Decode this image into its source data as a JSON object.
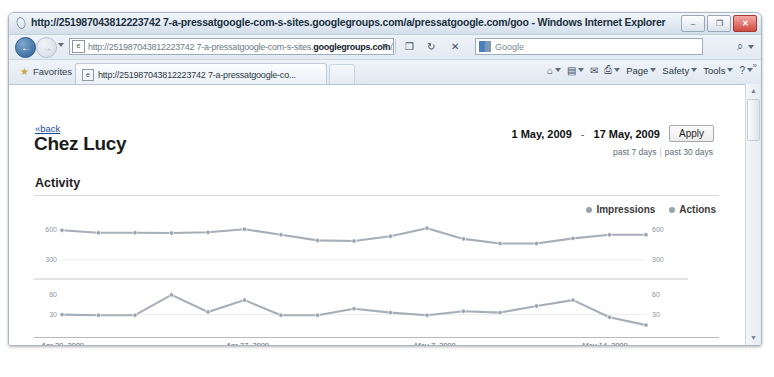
{
  "window": {
    "title": "http://251987043812223742 7-a-pressatgoogle-com-s-sites.googlegroups.com/a/pressatgoogle.com/goo - Windows Internet Explorer",
    "minimize_label": "–",
    "maximize_label": "❐",
    "close_label": "✕"
  },
  "navigation": {
    "back_label": "←",
    "forward_label": "→",
    "url_prefix": "http://251987043812223742 7-a-pressatgoogle-com-s-sites.",
    "url_host": "googlegroups.com",
    "url_suffix": "/a/pressatgoogle.com/",
    "compat_label": "❐",
    "refresh_label": "↻",
    "stop_label": "✕",
    "search_placeholder": "Google",
    "search_go_label": "⌕",
    "favicon_label": "e"
  },
  "favbar": {
    "star_icon": "★",
    "favorites_label": "Favorites",
    "tab_label": "http://251987043812223742 7-a-pressatgoogle-co...",
    "tab_favicon": "e",
    "commands": [
      {
        "name": "home",
        "glyph": "⌂",
        "label": "",
        "dropdown": true
      },
      {
        "name": "feeds",
        "glyph": "▤",
        "label": "",
        "dropdown": true
      },
      {
        "name": "read-mail",
        "glyph": "✉",
        "label": "",
        "dropdown": false
      },
      {
        "name": "print",
        "glyph": "⎙",
        "label": "",
        "dropdown": true
      },
      {
        "name": "page",
        "glyph": "",
        "label": "Page",
        "dropdown": true
      },
      {
        "name": "safety",
        "glyph": "",
        "label": "Safety",
        "dropdown": true
      },
      {
        "name": "tools",
        "glyph": "",
        "label": "Tools",
        "dropdown": true
      },
      {
        "name": "help",
        "glyph": "?",
        "label": "",
        "dropdown": true
      }
    ],
    "overflow_label": "»"
  },
  "scrollbar": {
    "up_label": "▲",
    "down_label": "▼"
  },
  "page": {
    "back_link": "«back",
    "title": "Chez Lucy",
    "date_from": "1 May, 2009",
    "date_separator": "-",
    "date_to": "17 May, 2009",
    "apply_label": "Apply",
    "quick_7": "past 7 days",
    "quick_sep": "|",
    "quick_30": "past 30 days",
    "section_title": "Activity"
  },
  "chart_data": {
    "type": "line",
    "title": "Activity",
    "xlabel": "",
    "grid": false,
    "legend_position": "top-right",
    "legend": [
      {
        "name": "Impressions",
        "color": "#9aa3ad"
      },
      {
        "name": "Actions",
        "color": "#9aa3ad"
      }
    ],
    "x_tick_labels": [
      "Apr 20, 2009",
      "Apr 27, 2009",
      "May 7, 2009",
      "May 14, 2009"
    ],
    "x_tick_positions": [
      0.01,
      0.28,
      0.555,
      0.8
    ],
    "panels": [
      {
        "name": "Impressions",
        "y_ticks_left": [
          "600",
          "300"
        ],
        "y_ticks_right": [
          "600",
          "300"
        ],
        "ylim": [
          250,
          680
        ],
        "values": [
          590,
          565,
          565,
          563,
          570,
          600,
          545,
          490,
          485,
          530,
          610,
          505,
          460,
          460,
          510,
          545,
          545
        ]
      },
      {
        "name": "Actions",
        "y_ticks_left": [
          "60",
          "30"
        ],
        "y_ticks_right": [
          "60",
          "30"
        ],
        "ylim": [
          5,
          72
        ],
        "values": [
          30,
          29,
          29,
          60,
          34,
          52,
          29,
          29,
          39,
          33,
          29,
          35,
          33,
          43,
          52,
          26,
          14
        ]
      }
    ]
  }
}
